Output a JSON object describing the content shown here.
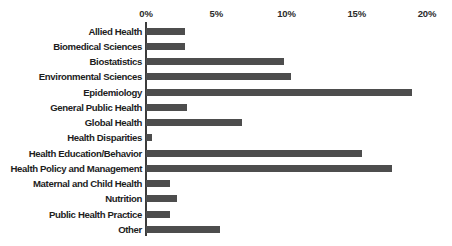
{
  "chart_data": {
    "type": "bar",
    "orientation": "horizontal",
    "title": "",
    "subtitle": "",
    "xlabel": "",
    "ylabel": "",
    "xlim": [
      0,
      20
    ],
    "grid": false,
    "legend": null,
    "bar_color": "#4d4d4d",
    "axis_color": "#3c3c3c",
    "tick_labels": [
      "0%",
      "5%",
      "10%",
      "15%",
      "20%"
    ],
    "tick_values": [
      0,
      5,
      10,
      15,
      20
    ],
    "tick_suffix": "%",
    "categories": [
      "Allied Health",
      "Biomedical Sciences",
      "Biostatistics",
      "Environmental Sciences",
      "Epidemiology",
      "General Public Health",
      "Global Health",
      "Health Disparities",
      "Health Education/Behavior",
      "Health Policy and Management",
      "Maternal and Child Health",
      "Nutrition",
      "Public Health Practice",
      "Other"
    ],
    "values": [
      2.8,
      2.8,
      9.8,
      10.3,
      18.9,
      2.9,
      6.8,
      0.4,
      15.4,
      17.5,
      1.7,
      2.2,
      1.7,
      5.3
    ]
  }
}
